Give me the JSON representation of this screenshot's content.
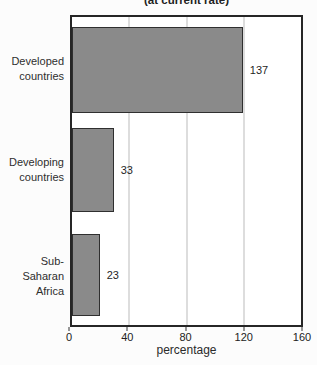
{
  "chart_data": {
    "type": "bar",
    "orientation": "horizontal",
    "title": "(at current rate)",
    "title_clipped_at_top": true,
    "categories": [
      "Developed\ncountries",
      "Developing\ncountries",
      "Sub-Saharan\nAfrica"
    ],
    "values": [
      137,
      33,
      23
    ],
    "value_labels": [
      "137",
      "33",
      "23"
    ],
    "xlabel": "percentage",
    "xlim": [
      0,
      160
    ],
    "x_ticks": [
      0,
      40,
      80,
      120,
      160
    ],
    "gridlines": [
      40,
      80,
      120
    ],
    "legend": "none",
    "colors": {
      "bar_fill": "#8a8a8a",
      "bar_border": "#2f2f2f",
      "plot_border": "#262626",
      "gridline": "#bcbcbc",
      "text": "#2b2b2b",
      "background": "#fcfcfc"
    },
    "layout": {
      "bars": [
        {
          "top_pct": 3.2,
          "height_pct": 27.9,
          "width_pct": 74.6
        },
        {
          "top_pct": 36.2,
          "height_pct": 27.2,
          "width_pct": 18.2
        },
        {
          "top_pct": 70.3,
          "height_pct": 26.8,
          "width_pct": 12.1
        }
      ]
    }
  }
}
